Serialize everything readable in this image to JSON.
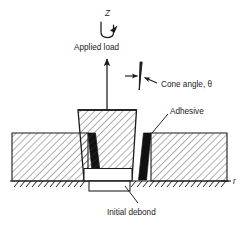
{
  "figure": {
    "type": "engineering-cross-section-diagram",
    "background_color": "#ffffff",
    "line_color": "#1a1a1a",
    "adhesive_color": "#111111",
    "hatch_color": "#4a4a4a"
  },
  "labels": {
    "axis_z": "Z",
    "axis_r": "r",
    "applied_load": "Applied load",
    "cone_angle": "Cone angle, θ",
    "adhesive": "Adhesive",
    "initial_debond": "Initial debond"
  },
  "annotations": {
    "torsion_arrow": "curved-rotation-arrow",
    "load_arrow": "up-arrow",
    "cone_angle_arrows": "two-inward-arrows",
    "adhesive_leader": "leader-line",
    "debond_leader": "leader-line",
    "ground_support": "hatched-fixed-support"
  },
  "geometry": {
    "plate_left": {
      "x": 12,
      "y": 133,
      "w": 76,
      "h": 48
    },
    "plate_right": {
      "x": 151,
      "y": 133,
      "w": 76,
      "h": 48
    },
    "cone_top_width": 58,
    "cone_bottom_width": 40,
    "cone_top_y": 110,
    "cone_bottom_y": 180,
    "debond_box": {
      "x": 88,
      "y": 172,
      "w": 46,
      "h": 16
    },
    "baseline_y": 181
  }
}
